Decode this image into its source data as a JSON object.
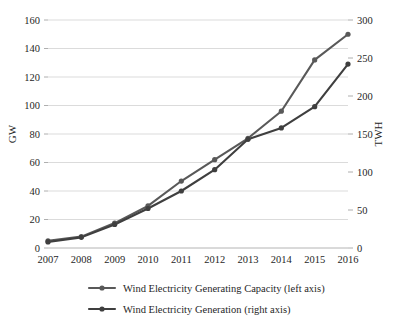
{
  "chart_data": {
    "type": "line",
    "title": "",
    "subtitle": "",
    "xlabel": "",
    "ylabel": "GW",
    "y2label": "TWH",
    "categories": [
      "2007",
      "2008",
      "2009",
      "2010",
      "2011",
      "2012",
      "2013",
      "2014",
      "2015",
      "2016"
    ],
    "x": [
      2007,
      2008,
      2009,
      2010,
      2011,
      2012,
      2013,
      2014,
      2015,
      2016
    ],
    "ylim": [
      0,
      160
    ],
    "y2lim": [
      0,
      300
    ],
    "yticks": [
      0,
      20,
      40,
      60,
      80,
      100,
      120,
      140,
      160
    ],
    "y2ticks": [
      0,
      50,
      100,
      150,
      200,
      250,
      300
    ],
    "grid": true,
    "legend_position": "bottom",
    "series": [
      {
        "name": "Wind Electricity Generating Capacity (left axis)",
        "axis": "left",
        "unit": "GW",
        "color": "#595959",
        "values": [
          5,
          8,
          17.5,
          29.5,
          47,
          62,
          77,
          96,
          132,
          150
        ]
      },
      {
        "name": "Wind Electricity Generation (right axis)",
        "axis": "right",
        "unit": "TWH",
        "color": "#3f3f3f",
        "values": [
          8,
          14,
          31,
          52,
          75,
          103,
          143,
          158,
          186,
          242
        ]
      }
    ]
  },
  "axes": {
    "left": {
      "title": "GW",
      "tick_labels": [
        "0",
        "20",
        "40",
        "60",
        "80",
        "100",
        "120",
        "140",
        "160"
      ]
    },
    "right": {
      "title": "TWH",
      "tick_labels": [
        "0",
        "50",
        "100",
        "150",
        "200",
        "250",
        "300"
      ]
    },
    "bottom": {
      "tick_labels": [
        "2007",
        "2008",
        "2009",
        "2010",
        "2011",
        "2012",
        "2013",
        "2014",
        "2015",
        "2016"
      ]
    }
  },
  "legend": {
    "items": [
      {
        "label": "Wind Electricity Generating Capacity (left axis)",
        "color": "#595959"
      },
      {
        "label": "Wind Electricity Generation (right axis)",
        "color": "#3f3f3f"
      }
    ]
  }
}
